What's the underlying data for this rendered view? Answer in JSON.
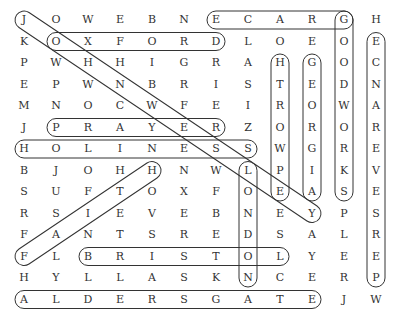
{
  "puzzle": {
    "type": "word-search",
    "columns": 12,
    "rows": 14,
    "grid": [
      [
        "J",
        "O",
        "W",
        "E",
        "B",
        "N",
        "E",
        "C",
        "A",
        "R",
        "G",
        "H"
      ],
      [
        "K",
        "O",
        "X",
        "F",
        "O",
        "R",
        "D",
        "L",
        "O",
        "E",
        "O",
        "E"
      ],
      [
        "P",
        "W",
        "H",
        "H",
        "I",
        "G",
        "R",
        "A",
        "H",
        "G",
        "O",
        "C"
      ],
      [
        "E",
        "P",
        "W",
        "N",
        "B",
        "R",
        "I",
        "S",
        "T",
        "E",
        "D",
        "N"
      ],
      [
        "M",
        "N",
        "O",
        "C",
        "W",
        "F",
        "E",
        "I",
        "R",
        "O",
        "W",
        "A"
      ],
      [
        "J",
        "P",
        "R",
        "A",
        "Y",
        "E",
        "R",
        "Z",
        "O",
        "R",
        "O",
        "R"
      ],
      [
        "H",
        "O",
        "L",
        "I",
        "N",
        "E",
        "S",
        "S",
        "W",
        "G",
        "R",
        "E"
      ],
      [
        "B",
        "J",
        "O",
        "H",
        "H",
        "N",
        "W",
        "L",
        "P",
        "I",
        "K",
        "V"
      ],
      [
        "S",
        "U",
        "F",
        "T",
        "O",
        "X",
        "F",
        "O",
        "E",
        "A",
        "S",
        "E"
      ],
      [
        "R",
        "S",
        "I",
        "E",
        "V",
        "E",
        "B",
        "N",
        "E",
        "Y",
        "P",
        "S"
      ],
      [
        "F",
        "A",
        "N",
        "T",
        "S",
        "R",
        "E",
        "D",
        "S",
        "A",
        "L",
        "R"
      ],
      [
        "F",
        "L",
        "B",
        "R",
        "I",
        "S",
        "T",
        "O",
        "L",
        "Y",
        "E",
        "E"
      ],
      [
        "H",
        "Y",
        "L",
        "L",
        "A",
        "S",
        "K",
        "N",
        "C",
        "E",
        "R",
        "P"
      ],
      [
        "A",
        "L",
        "D",
        "E",
        "R",
        "S",
        "G",
        "A",
        "T",
        "E",
        "J",
        "W"
      ]
    ],
    "found_words": [
      {
        "word": "GRACE",
        "start": [
          0,
          10
        ],
        "end": [
          0,
          6
        ]
      },
      {
        "word": "OXFORD",
        "start": [
          1,
          1
        ],
        "end": [
          1,
          6
        ]
      },
      {
        "word": "PRAYER",
        "start": [
          5,
          1
        ],
        "end": [
          5,
          6
        ]
      },
      {
        "word": "HOLINESS",
        "start": [
          6,
          0
        ],
        "end": [
          6,
          7
        ]
      },
      {
        "word": "BRISTOL",
        "start": [
          11,
          2
        ],
        "end": [
          11,
          8
        ]
      },
      {
        "word": "ALDERSGATE",
        "start": [
          13,
          0
        ],
        "end": [
          13,
          9
        ]
      },
      {
        "word": "JOHNWESLEY",
        "start": [
          0,
          0
        ],
        "end": [
          9,
          9
        ]
      },
      {
        "word": "FAITH",
        "start": [
          11,
          0
        ],
        "end": [
          7,
          4
        ]
      },
      {
        "word": "EPWORTH",
        "start": [
          8,
          8
        ],
        "end": [
          2,
          8
        ]
      },
      {
        "word": "GEORGIA",
        "start": [
          2,
          9
        ],
        "end": [
          8,
          9
        ]
      },
      {
        "word": "GOODWORKS",
        "start": [
          0,
          10
        ],
        "end": [
          8,
          10
        ]
      },
      {
        "word": "PERSEVERANCE",
        "start": [
          12,
          11
        ],
        "end": [
          1,
          11
        ]
      },
      {
        "word": "LONDON",
        "start": [
          7,
          7
        ],
        "end": [
          12,
          7
        ]
      }
    ],
    "ring_color": "#333333",
    "letter_color": "#333333"
  }
}
